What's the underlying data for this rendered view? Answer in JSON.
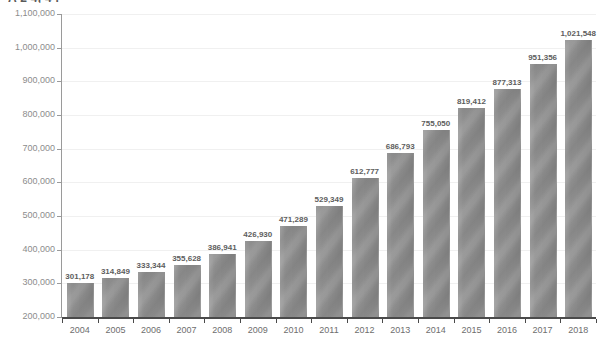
{
  "title": "A 2 4, 4 .",
  "chart_data": {
    "type": "bar",
    "title": "",
    "xlabel": "",
    "ylabel": "",
    "ylim": [
      200000,
      1100000
    ],
    "ytick_step": 100000,
    "grid": true,
    "legend": false,
    "bar_color": "#8c8c8c",
    "categories": [
      "2004",
      "2005",
      "2006",
      "2007",
      "2008",
      "2009",
      "2010",
      "2011",
      "2012",
      "2013",
      "2014",
      "2015",
      "2016",
      "2017",
      "2018"
    ],
    "values": [
      301178,
      314849,
      333344,
      355628,
      386941,
      426930,
      471289,
      529349,
      612777,
      686793,
      755050,
      819412,
      877313,
      951356,
      1021548
    ],
    "data_labels": [
      "301,178",
      "314,849",
      "333,344",
      "355,628",
      "386,941",
      "426,930",
      "471,289",
      "529,349",
      "612,777",
      "686,793",
      "755,050",
      "819,412",
      "877,313",
      "951,356",
      "1,021,548"
    ],
    "ytick_labels": [
      "1,100,000",
      "1,000,000",
      "900,000",
      "800,000",
      "700,000",
      "600,000",
      "500,000",
      "400,000",
      "300,000",
      "200,000"
    ],
    "ytick_values": [
      1100000,
      1000000,
      900000,
      800000,
      700000,
      600000,
      500000,
      400000,
      300000,
      200000
    ]
  }
}
